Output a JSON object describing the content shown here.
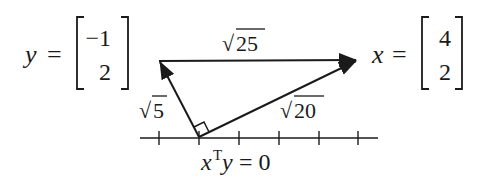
{
  "diagram": {
    "vectors": {
      "y": {
        "label": "y",
        "equals": "=",
        "components": [
          "−1",
          "2"
        ]
      },
      "x": {
        "label": "x",
        "equals": "=",
        "components": [
          "4",
          "2"
        ]
      }
    },
    "edge_labels": {
      "hypotenuse": {
        "radical": "√",
        "value": "25"
      },
      "y_length": {
        "radical": "√",
        "value": "5"
      },
      "x_length": {
        "radical": "√",
        "value": "20"
      }
    },
    "caption": {
      "var1": "x",
      "superscript": "T",
      "var2": "y",
      "rest": " = 0"
    },
    "axis": {
      "tick_count": 6
    },
    "colors": {
      "ink": "#1a1a1a",
      "background": "#ffffff"
    }
  }
}
